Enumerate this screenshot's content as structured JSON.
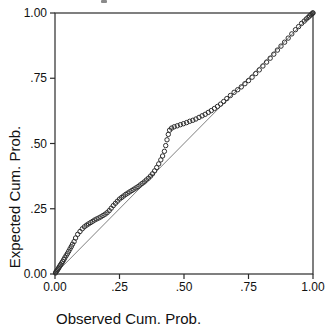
{
  "figure": {
    "kind": "P-P plot",
    "background_color": "#ffffff",
    "frame_color": "#2b2b2b",
    "marker_color": "#2e2e2e",
    "reference_line_color": "#707070",
    "text_color": "#111111"
  },
  "chart_data": {
    "type": "scatter",
    "title": "",
    "xlabel": "Observed Cum. Prob.",
    "ylabel": "Expected Cum. Prob.",
    "xlim": [
      0,
      1
    ],
    "ylim": [
      0,
      1
    ],
    "grid": false,
    "legend": "none",
    "marker": "open-circle",
    "x_tick_labels": [
      "0.00",
      ".25",
      ".50",
      ".75",
      "1.00"
    ],
    "x_tick_values": [
      0,
      0.25,
      0.5,
      0.75,
      1
    ],
    "y_tick_labels": [
      "0.00",
      ".25",
      ".50",
      ".75",
      "1.00"
    ],
    "y_tick_values": [
      0,
      0.25,
      0.5,
      0.75,
      1
    ],
    "reference_line": {
      "from": [
        0,
        0
      ],
      "to": [
        1,
        1
      ]
    },
    "points": [
      [
        0.002,
        0.004
      ],
      [
        0.004,
        0.008
      ],
      [
        0.007,
        0.012
      ],
      [
        0.01,
        0.016
      ],
      [
        0.013,
        0.021
      ],
      [
        0.016,
        0.026
      ],
      [
        0.019,
        0.031
      ],
      [
        0.022,
        0.036
      ],
      [
        0.026,
        0.042
      ],
      [
        0.03,
        0.048
      ],
      [
        0.034,
        0.055
      ],
      [
        0.038,
        0.062
      ],
      [
        0.043,
        0.07
      ],
      [
        0.048,
        0.078
      ],
      [
        0.053,
        0.087
      ],
      [
        0.058,
        0.096
      ],
      [
        0.063,
        0.105
      ],
      [
        0.068,
        0.114
      ],
      [
        0.074,
        0.124
      ],
      [
        0.08,
        0.138
      ],
      [
        0.088,
        0.152
      ],
      [
        0.097,
        0.163
      ],
      [
        0.106,
        0.173
      ],
      [
        0.114,
        0.181
      ],
      [
        0.122,
        0.187
      ],
      [
        0.13,
        0.192
      ],
      [
        0.138,
        0.197
      ],
      [
        0.146,
        0.202
      ],
      [
        0.154,
        0.207
      ],
      [
        0.162,
        0.211
      ],
      [
        0.17,
        0.215
      ],
      [
        0.178,
        0.219
      ],
      [
        0.186,
        0.224
      ],
      [
        0.194,
        0.229
      ],
      [
        0.202,
        0.235
      ],
      [
        0.21,
        0.243
      ],
      [
        0.218,
        0.252
      ],
      [
        0.226,
        0.262
      ],
      [
        0.234,
        0.271
      ],
      [
        0.242,
        0.279
      ],
      [
        0.25,
        0.287
      ],
      [
        0.258,
        0.293
      ],
      [
        0.266,
        0.299
      ],
      [
        0.274,
        0.305
      ],
      [
        0.282,
        0.31
      ],
      [
        0.29,
        0.315
      ],
      [
        0.298,
        0.32
      ],
      [
        0.306,
        0.325
      ],
      [
        0.314,
        0.33
      ],
      [
        0.322,
        0.335
      ],
      [
        0.33,
        0.341
      ],
      [
        0.338,
        0.347
      ],
      [
        0.346,
        0.353
      ],
      [
        0.354,
        0.36
      ],
      [
        0.362,
        0.367
      ],
      [
        0.37,
        0.375
      ],
      [
        0.378,
        0.384
      ],
      [
        0.386,
        0.395
      ],
      [
        0.394,
        0.408
      ],
      [
        0.402,
        0.422
      ],
      [
        0.41,
        0.437
      ],
      [
        0.417,
        0.452
      ],
      [
        0.424,
        0.47
      ],
      [
        0.429,
        0.492
      ],
      [
        0.434,
        0.514
      ],
      [
        0.439,
        0.535
      ],
      [
        0.444,
        0.551
      ],
      [
        0.452,
        0.559
      ],
      [
        0.462,
        0.564
      ],
      [
        0.474,
        0.568
      ],
      [
        0.486,
        0.572
      ],
      [
        0.498,
        0.576
      ],
      [
        0.51,
        0.58
      ],
      [
        0.522,
        0.585
      ],
      [
        0.534,
        0.589
      ],
      [
        0.546,
        0.594
      ],
      [
        0.558,
        0.6
      ],
      [
        0.57,
        0.606
      ],
      [
        0.582,
        0.612
      ],
      [
        0.594,
        0.619
      ],
      [
        0.606,
        0.626
      ],
      [
        0.618,
        0.634
      ],
      [
        0.63,
        0.642
      ],
      [
        0.642,
        0.651
      ],
      [
        0.654,
        0.661
      ],
      [
        0.666,
        0.672
      ],
      [
        0.68,
        0.684
      ],
      [
        0.694,
        0.696
      ],
      [
        0.708,
        0.706
      ],
      [
        0.722,
        0.717
      ],
      [
        0.736,
        0.729
      ],
      [
        0.75,
        0.741
      ],
      [
        0.764,
        0.754
      ],
      [
        0.778,
        0.768
      ],
      [
        0.792,
        0.782
      ],
      [
        0.806,
        0.797
      ],
      [
        0.82,
        0.812
      ],
      [
        0.834,
        0.827
      ],
      [
        0.848,
        0.842
      ],
      [
        0.862,
        0.858
      ],
      [
        0.876,
        0.873
      ],
      [
        0.89,
        0.888
      ],
      [
        0.904,
        0.904
      ],
      [
        0.918,
        0.92
      ],
      [
        0.932,
        0.936
      ],
      [
        0.944,
        0.948
      ],
      [
        0.956,
        0.96
      ],
      [
        0.966,
        0.969
      ],
      [
        0.974,
        0.977
      ],
      [
        0.981,
        0.983
      ],
      [
        0.987,
        0.989
      ],
      [
        0.992,
        0.993
      ],
      [
        0.996,
        0.997
      ],
      [
        0.999,
        1.0
      ],
      [
        1.0,
        1.0
      ]
    ]
  }
}
